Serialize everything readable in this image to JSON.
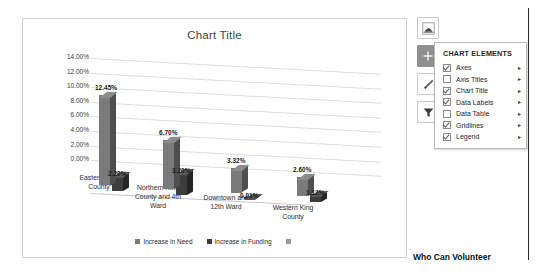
{
  "chart_data": {
    "type": "bar",
    "title": "Chart Title",
    "xlabel": "",
    "ylabel": "",
    "ylim": [
      0,
      14
    ],
    "grid": true,
    "legend_position": "bottom",
    "categories": [
      "Eastern King County",
      "Northern King County and 4th Ward",
      "Downtown and 12th Ward",
      "Western King County"
    ],
    "ytick_labels": [
      "0.00%",
      "2.00%",
      "4.00%",
      "6.00%",
      "8.00%",
      "10.00%",
      "12.00%",
      "14.00%"
    ],
    "ytick_values": [
      0,
      2,
      4,
      6,
      8,
      10,
      12,
      14
    ],
    "series": [
      {
        "name": "Increase in Need",
        "values": [
          12.45,
          6.7,
          3.32,
          2.6
        ],
        "labels": [
          "12.45%",
          "6.70%",
          "3.32%",
          "2.60%"
        ],
        "color": "#7a7a7a"
      },
      {
        "name": "Increase in Funding",
        "values": [
          2.2,
          3.2,
          0.01,
          1.12
        ],
        "labels": [
          "2.20%",
          "3.20%",
          "0.01%",
          "1.12%"
        ],
        "color": "#3d3d3d"
      },
      {
        "name": "",
        "values": [
          0,
          0,
          0,
          0
        ],
        "labels": [
          "",
          "",
          "",
          ""
        ],
        "color": "#9a9a9a"
      }
    ]
  },
  "chart": {
    "title": "Chart Title",
    "ticks": [
      "14.00%",
      "12.00%",
      "10.00%",
      "8.00%",
      "6.00%",
      "4.00%",
      "2.00%",
      "0.00%"
    ],
    "categories": [
      "Eastern King County",
      "Northern King County and 4th Ward",
      "Downtown and 12th Ward",
      "Western King County"
    ],
    "legend": [
      {
        "label": "Increase in Need"
      },
      {
        "label": "Increase in Funding"
      },
      {
        "label": ""
      }
    ],
    "data_labels": {
      "g1s1": "12.45%",
      "g1s2": "2.20%",
      "g2s1": "6.70%",
      "g2s2": "3.20%",
      "g3s1": "3.32%",
      "g3s2": "0.01%",
      "g4s1": "2.60%",
      "g4s2": "1.12%"
    }
  },
  "toolbar": {
    "buttons": [
      {
        "name": "chart-options-icon",
        "title": "Chart Options",
        "active": false
      },
      {
        "name": "plus-icon",
        "title": "Chart Elements",
        "active": true
      },
      {
        "name": "brush-icon",
        "title": "Chart Styles",
        "active": false
      },
      {
        "name": "funnel-icon",
        "title": "Chart Filters",
        "active": false
      }
    ]
  },
  "flyout": {
    "heading": "CHART ELEMENTS",
    "items": [
      {
        "label": "Axes",
        "checked": true
      },
      {
        "label": "Axis Titles",
        "checked": false
      },
      {
        "label": "Chart Title",
        "checked": true
      },
      {
        "label": "Data Labels",
        "checked": true
      },
      {
        "label": "Data Table",
        "checked": false
      },
      {
        "label": "Gridlines",
        "checked": true
      },
      {
        "label": "Legend",
        "checked": true
      }
    ],
    "arrow": "▸"
  },
  "page": {
    "caption": "Who Can Volunteer"
  },
  "colors": {
    "series1": "#7a7a7a",
    "series2": "#3d3d3d",
    "series3": "#9a9a9a",
    "grid": "#dcdcdc",
    "frame": "#d0d0d0"
  }
}
